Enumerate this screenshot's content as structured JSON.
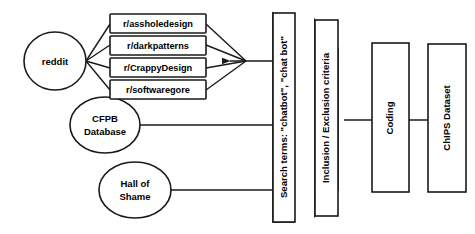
{
  "diagram": {
    "type": "flowchart",
    "background_color": "#ffffff",
    "stroke_color": "#1a1a1a",
    "sources": [
      {
        "id": "reddit",
        "label": "reddit",
        "shape": "ellipse"
      },
      {
        "id": "cfpb",
        "label_line1": "CFPB",
        "label_line2": "Database",
        "shape": "ellipse"
      },
      {
        "id": "hall-of-shame",
        "label_line1": "Hall of",
        "label_line2": "Shame",
        "shape": "ellipse"
      }
    ],
    "subreddits": [
      {
        "id": "assholedesign",
        "label": "r/assholedesign"
      },
      {
        "id": "darkpatterns",
        "label": "r/darkpatterns"
      },
      {
        "id": "crappydesign",
        "label": "r/CrappyDesign"
      },
      {
        "id": "softwaregore",
        "label": "r/softwaregore"
      }
    ],
    "stages": [
      {
        "id": "search-terms",
        "label": "Search terms: \"chatbot\", \"chat bot\"",
        "style": "3d-box"
      },
      {
        "id": "inclusion-exclusion",
        "label": "Inclusion / Exclusion criteria",
        "style": "3d-box"
      },
      {
        "id": "coding",
        "label": "Coding",
        "style": "flat-box"
      },
      {
        "id": "chips-dataset",
        "label": "ChIPS Dataset",
        "style": "flat-box"
      }
    ]
  }
}
